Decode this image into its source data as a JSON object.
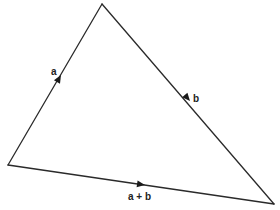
{
  "diagram": {
    "type": "vector-triangle",
    "colors": {
      "line": "#2a2a2a",
      "arrow": "#1a1a1a",
      "text": "#222222",
      "background": "#ffffff"
    },
    "vertices": {
      "left": [
        8,
        165
      ],
      "top": [
        102,
        4
      ],
      "right": [
        274,
        204
      ]
    },
    "edges": [
      {
        "name": "a",
        "label": "a",
        "from": "left",
        "to": "top",
        "arrow_at": [
          59,
          78
        ],
        "label_pos": [
          51,
          75
        ]
      },
      {
        "name": "b",
        "label": "b",
        "from": "top",
        "to": "right",
        "arrow_at": [
          189,
          98
        ],
        "label_pos": [
          193,
          102
        ]
      },
      {
        "name": "a-plus-b",
        "label": "a + b",
        "from": "left",
        "to": "right",
        "arrow_at": [
          142,
          185
        ],
        "label_pos": [
          128,
          200
        ]
      }
    ]
  }
}
